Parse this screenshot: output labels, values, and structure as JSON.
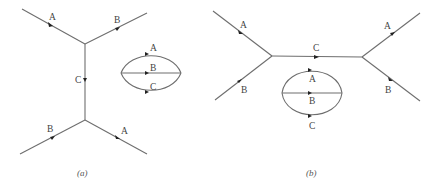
{
  "figure": {
    "panel_a": {
      "caption": "(a)",
      "external_lines": [
        {
          "label": "A",
          "position": "top-left"
        },
        {
          "label": "B",
          "position": "top-right"
        },
        {
          "label": "B",
          "position": "bottom-left"
        },
        {
          "label": "A",
          "position": "bottom-right"
        }
      ],
      "propagator": {
        "label": "C",
        "orientation": "vertical"
      },
      "loop": {
        "labels": [
          "A",
          "B",
          "C"
        ]
      }
    },
    "panel_b": {
      "caption": "(b)",
      "external_lines": [
        {
          "label": "A",
          "position": "top-left"
        },
        {
          "label": "B",
          "position": "bottom-left"
        },
        {
          "label": "A",
          "position": "top-right"
        },
        {
          "label": "B",
          "position": "bottom-right"
        }
      ],
      "propagator": {
        "label": "C",
        "orientation": "horizontal"
      },
      "loop": {
        "labels": [
          "A",
          "B",
          "C"
        ]
      }
    }
  }
}
